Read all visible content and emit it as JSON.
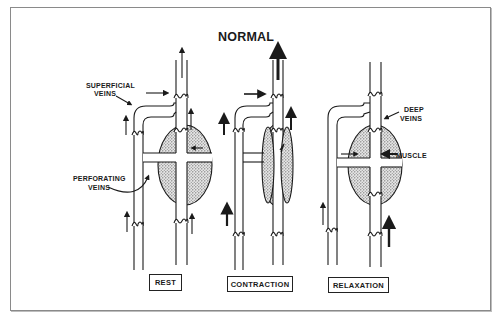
{
  "title": "NORMAL",
  "labels": {
    "superficial_veins_1": "SUPERFICIAL",
    "superficial_veins_2": "VEINS",
    "perforating_veins_1": "PERFORATING",
    "perforating_veins_2": "VEINS",
    "deep_veins_1": "DEEP",
    "deep_veins_2": "VEINS",
    "muscle": "MUSCLE"
  },
  "panels": [
    {
      "label": "REST",
      "description": "Muscle at rest; blood flows upward in both superficial and deep veins"
    },
    {
      "label": "CONTRACTION",
      "description": "Muscle contracts, compressing deep vein and pumping blood upward (bold arrow)"
    },
    {
      "label": "RELAXATION",
      "description": "Muscle relaxes; blood drawn from superficial veins through perforators into deep veins"
    }
  ],
  "colors": {
    "line": "#1a1a1a",
    "muscle_fill": "#bfbfbf",
    "frame": "#8a8a8a"
  }
}
